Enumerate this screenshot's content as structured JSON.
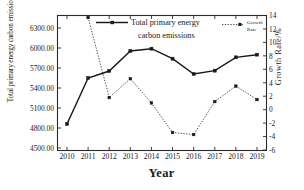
{
  "chart_data": {
    "type": "line",
    "title": "",
    "xlabel": "Year",
    "ylabel": "Total primary energy carbon emissions/(10⁴t)",
    "y2label": "Growth Rate/%",
    "categories": [
      "2010",
      "2011",
      "2012",
      "2013",
      "2014",
      "2015",
      "2016",
      "2017",
      "2018",
      "2019"
    ],
    "x": [
      2010,
      2011,
      2012,
      2013,
      2014,
      2015,
      2016,
      2017,
      2018,
      2019
    ],
    "ylim": [
      4500,
      6450
    ],
    "y2lim": [
      -6,
      14
    ],
    "yticks": [
      "4500.00",
      "4800.00",
      "5100.00",
      "5400.00",
      "5700.00",
      "6000.00",
      "6300.00"
    ],
    "ytick_values": [
      4500,
      4800,
      5100,
      5400,
      5700,
      6000,
      6300
    ],
    "y2ticks": [
      "-6",
      "-4",
      "-2",
      "0",
      "2",
      "4",
      "6",
      "8",
      "10",
      "12",
      "14"
    ],
    "y2tick_values": [
      -6,
      -4,
      -2,
      0,
      2,
      4,
      6,
      8,
      10,
      12,
      14
    ],
    "grid": false,
    "legend_position": "top-center",
    "series": [
      {
        "name": "Total primary energy carbon emissions",
        "axis": "left",
        "style": "solid",
        "marker": "square",
        "color": "#1a1a1a",
        "values": [
          4860,
          5550,
          5655,
          5955,
          5990,
          5840,
          5610,
          5660,
          5860,
          5900
        ]
      },
      {
        "name": "Growth Rate",
        "axis": "right",
        "style": "dotted",
        "marker": "square",
        "color": "#1a1a1a",
        "values": [
          null,
          13.7,
          1.8,
          4.6,
          1.0,
          -3.4,
          -3.7,
          1.2,
          3.5,
          1.5
        ]
      }
    ]
  },
  "legend": {
    "series1_line1": "Total primary energy",
    "series1_line2": "carbon emissions",
    "series2_line1": "Growth",
    "series2_line2": "Rate"
  },
  "axes": {
    "x_title": "Year",
    "y_title_prefix": "Total primary energy carbon emissions/(10",
    "y_title_sup": "4",
    "y_title_suffix": "t)",
    "y2_title": "Growth Rate/%"
  },
  "colors": {
    "line": "#1a1a1a",
    "background": "#ffffff",
    "frame": "#2b2b2b"
  }
}
